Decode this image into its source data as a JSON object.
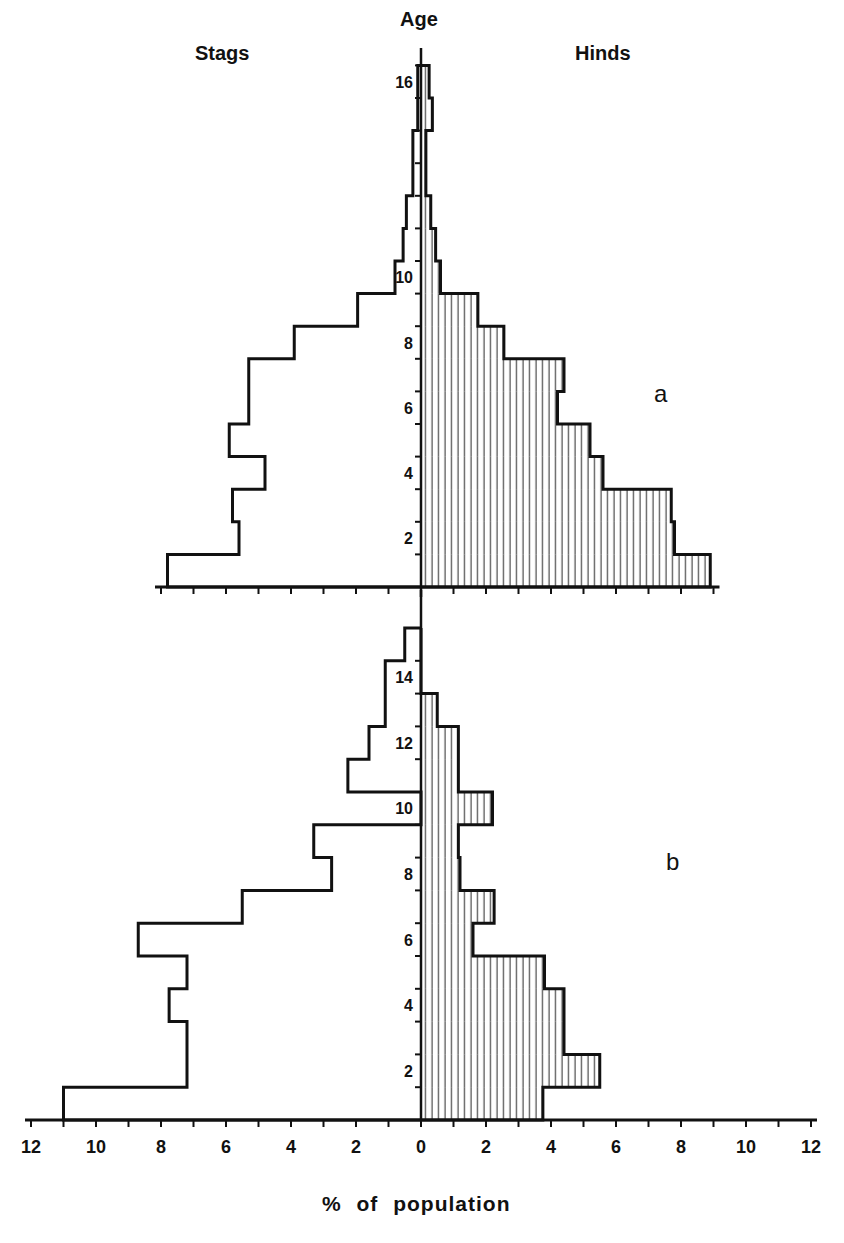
{
  "chart_data": {
    "type": "bar",
    "subtype": "population-pyramid",
    "title": "",
    "ylabel": "Age",
    "xlabel": "% of population",
    "left_label": "Stags",
    "right_label": "Hinds",
    "x_ticks": [
      12,
      10,
      8,
      6,
      4,
      2,
      0,
      2,
      4,
      6,
      8,
      10,
      12
    ],
    "xlim": [
      -12,
      12
    ],
    "grid": false,
    "panels": [
      {
        "label": "a",
        "age_ticks": [
          2,
          4,
          6,
          8,
          10,
          16
        ],
        "ages": [
          1,
          2,
          3,
          4,
          5,
          6,
          7,
          8,
          9,
          10,
          11,
          12,
          13,
          14,
          15,
          16
        ],
        "series": [
          {
            "name": "Stags",
            "side": "left",
            "values": [
              7.8,
              5.6,
              5.8,
              4.8,
              5.9,
              5.3,
              5.3,
              3.9,
              1.95,
              0.8,
              0.55,
              0.45,
              0.25,
              0.25,
              0.1,
              0.1
            ]
          },
          {
            "name": "Hinds",
            "side": "right",
            "hatched": true,
            "values": [
              8.9,
              7.8,
              7.7,
              5.6,
              5.2,
              4.2,
              4.4,
              2.55,
              1.75,
              0.6,
              0.45,
              0.3,
              0.15,
              0.15,
              0.35,
              0.25
            ]
          }
        ],
        "axis_range": [
          -8,
          9
        ]
      },
      {
        "label": "b",
        "age_ticks": [
          2,
          4,
          6,
          8,
          10,
          12,
          14
        ],
        "ages": [
          1,
          2,
          3,
          4,
          5,
          6,
          7,
          8,
          9,
          10,
          11,
          12,
          13,
          14,
          15
        ],
        "series": [
          {
            "name": "Stags",
            "side": "left",
            "values": [
              11.0,
              7.2,
              7.2,
              7.75,
              7.2,
              8.7,
              5.5,
              2.75,
              3.3,
              0,
              2.25,
              1.6,
              1.1,
              1.1,
              0.5
            ]
          },
          {
            "name": "Hinds",
            "side": "right",
            "hatched": true,
            "values": [
              3.75,
              5.5,
              4.4,
              4.4,
              3.8,
              1.6,
              2.25,
              1.2,
              1.15,
              2.2,
              1.15,
              1.15,
              0.5,
              0,
              0
            ]
          }
        ],
        "axis_range": [
          -12,
          12
        ]
      }
    ]
  },
  "labels": {
    "age": "Age",
    "stags": "Stags",
    "hinds": "Hinds",
    "panel_a": "a",
    "panel_b": "b",
    "xlabel": "% of population"
  },
  "colors": {
    "ink": "#111111",
    "background": "#ffffff"
  }
}
